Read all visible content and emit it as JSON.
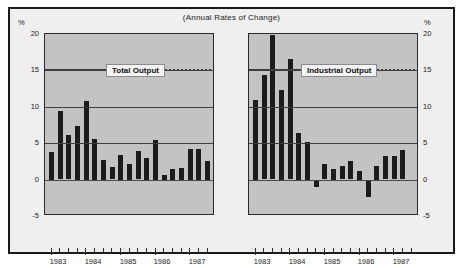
{
  "figure": {
    "title": "(Annual Rates of Change)",
    "background": "#efefef",
    "frame_color": "#1a1a1a",
    "bar_color": "#1c1c1c",
    "plot_fill": "#c9c9c9"
  },
  "axes": {
    "unit_label": "%",
    "y_ticks": [
      "20",
      "15",
      "10",
      "5",
      "0",
      "-5"
    ],
    "y_values": [
      20,
      15,
      10,
      5,
      0,
      -5
    ],
    "ylim": [
      -5,
      20
    ],
    "x_year_labels": [
      "1983",
      "1984",
      "1985",
      "1986",
      "1987"
    ]
  },
  "chart_data": [
    {
      "type": "bar",
      "title": "Total Output",
      "panel": "left",
      "xlabel": "",
      "ylabel": "%",
      "ylim": [
        -5,
        20
      ],
      "grid": true,
      "legend_position": "inside-top-center",
      "categories": [
        "1983Q1",
        "1983Q2",
        "1983Q3",
        "1983Q4",
        "1984Q1",
        "1984Q2",
        "1984Q3",
        "1984Q4",
        "1985Q1",
        "1985Q2",
        "1985Q3",
        "1985Q4",
        "1986Q1",
        "1986Q2",
        "1986Q3",
        "1986Q4",
        "1987Q1",
        "1987Q2",
        "1987Q3"
      ],
      "values": [
        3.8,
        9.4,
        6.1,
        7.4,
        10.8,
        5.6,
        2.7,
        1.7,
        3.4,
        2.2,
        3.9,
        3.0,
        5.5,
        0.7,
        1.5,
        1.6,
        4.2,
        4.2,
        2.6
      ]
    },
    {
      "type": "bar",
      "title": "Industrial Output",
      "panel": "right",
      "xlabel": "",
      "ylabel": "%",
      "ylim": [
        -5,
        20
      ],
      "grid": true,
      "legend_position": "inside-top-center",
      "categories": [
        "1983Q1",
        "1983Q2",
        "1983Q3",
        "1983Q4",
        "1984Q1",
        "1984Q2",
        "1984Q3",
        "1984Q4",
        "1985Q1",
        "1985Q2",
        "1985Q3",
        "1985Q4",
        "1986Q1",
        "1986Q2",
        "1986Q3",
        "1986Q4",
        "1987Q1",
        "1987Q2",
        "1987Q3"
      ],
      "values": [
        11.0,
        14.3,
        19.8,
        12.3,
        16.5,
        6.4,
        5.2,
        -1.0,
        2.1,
        1.5,
        1.8,
        2.5,
        1.2,
        -2.3,
        1.9,
        3.2,
        3.2,
        4.0,
        0
      ]
    }
  ]
}
